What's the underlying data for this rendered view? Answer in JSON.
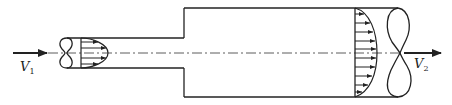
{
  "diagram": {
    "labels": {
      "inlet_velocity": "V",
      "inlet_velocity_sub": "1",
      "outlet_velocity": "V",
      "outlet_velocity_sub": "2"
    },
    "colors": {
      "stroke": "#222222",
      "background": "#ffffff"
    },
    "small_pipe": {
      "top_y": 38,
      "bottom_y": 68,
      "break_x": 64,
      "end_x": 184
    },
    "large_pipe": {
      "top_y": 8,
      "bottom_y": 97,
      "start_x": 184,
      "break_x": 405
    },
    "centerline_y": 53,
    "profiles": [
      {
        "name": "inlet-profile",
        "base_x": 81,
        "max_extent_x": 108,
        "arrows": 4
      },
      {
        "name": "outlet-profile",
        "base_x": 355,
        "max_extent_x": 376,
        "arrows": 10
      }
    ]
  }
}
